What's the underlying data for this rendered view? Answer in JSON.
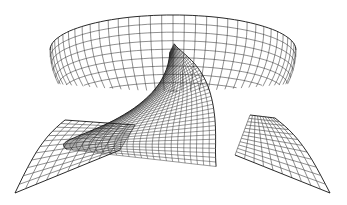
{
  "figure": {
    "style": "black line art on white",
    "colors": {
      "background": "#ffffff",
      "line": "#333333",
      "edge": "#111111"
    },
    "parts": [
      "bowl",
      "twisted-sheet",
      "left-wing",
      "right-wing"
    ]
  }
}
